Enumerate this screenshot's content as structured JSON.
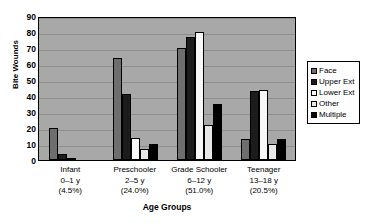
{
  "chart_data": {
    "type": "bar",
    "title": "",
    "xlabel": "Age Groups",
    "ylabel": "Bite Wounds",
    "ylim": [
      0,
      90
    ],
    "yticks": [
      0,
      10,
      20,
      30,
      40,
      50,
      60,
      70,
      80,
      90
    ],
    "grid": true,
    "legend_position": "right",
    "categories": [
      "Infant 0–1 y (4.5%)",
      "Preschooler 2–5 y (24.0%)",
      "Grade Schooler 6–12 y (51.0%)",
      "Teenager 13–18 y (20.5%)"
    ],
    "category_lines": [
      {
        "name": "Infant",
        "age": "0–1 y",
        "percent": "(4.5%)"
      },
      {
        "name": "Preschooler",
        "age": "2–5 y",
        "percent": "(24.0%)"
      },
      {
        "name": "Grade Schooler",
        "age": "6–12 y",
        "percent": "(51.0%)"
      },
      {
        "name": "Teenager",
        "age": "13–18 y",
        "percent": "(20.5%)"
      }
    ],
    "series": [
      {
        "name": "Face",
        "color": "#6e6e6e",
        "values": [
          20,
          64,
          70,
          13
        ]
      },
      {
        "name": "Upper Ext",
        "color": "#1c1c1c",
        "values": [
          4,
          41,
          77,
          43
        ]
      },
      {
        "name": "Lower Ext",
        "color": "#f7f7f7",
        "values": [
          1,
          14,
          80,
          44
        ]
      },
      {
        "name": "Other",
        "color": "#e8e8e8",
        "values": [
          0,
          7,
          22,
          10
        ]
      },
      {
        "name": "Multiple",
        "color": "#000000",
        "values": [
          0,
          10,
          35,
          13
        ]
      }
    ]
  },
  "colors": {
    "plot_background": "#a8a8a8",
    "gridline": "#8e8e8e",
    "axis": "#000000",
    "page_background": "#ffffff"
  }
}
